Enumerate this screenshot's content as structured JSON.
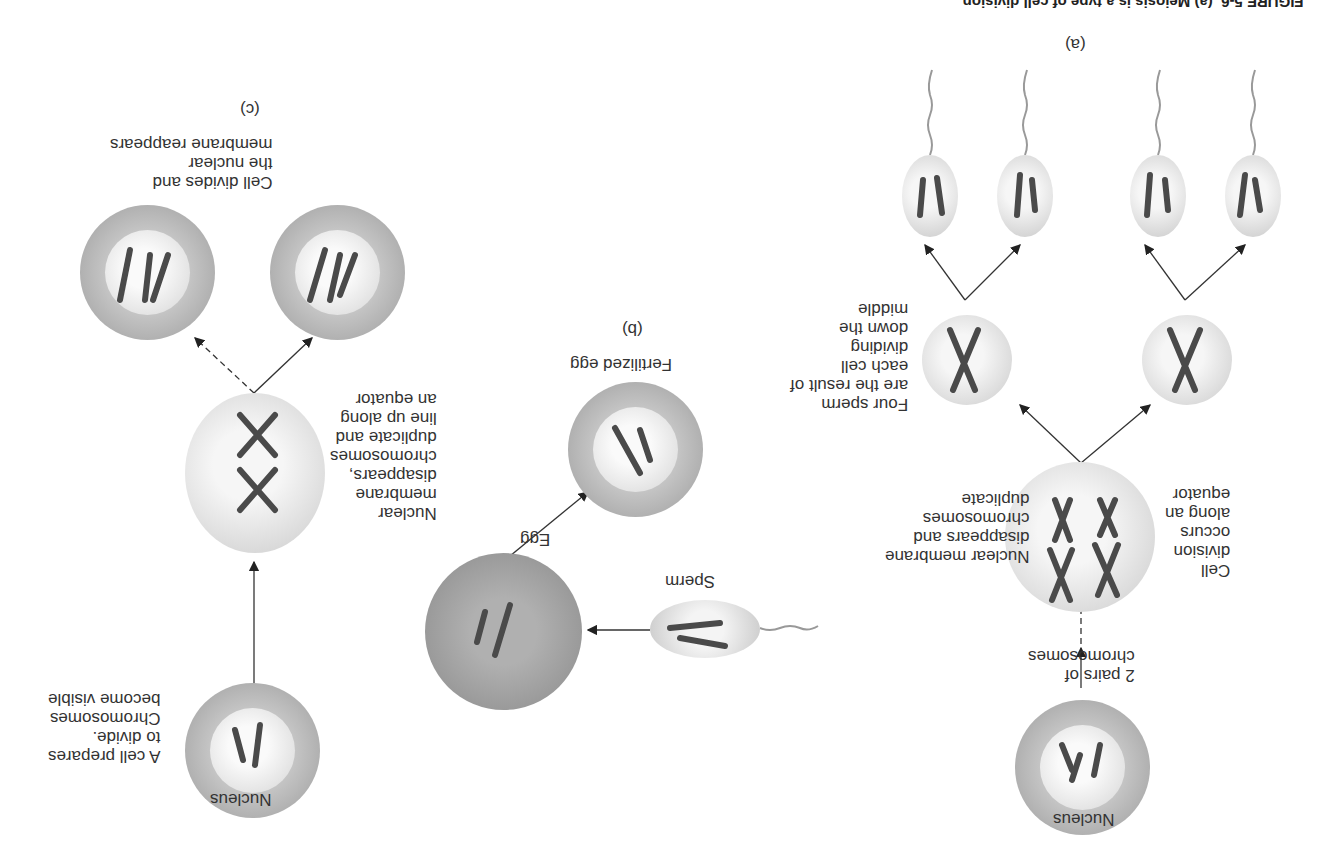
{
  "caption": "FIGURE 5-6  (a) Meiosis is a type of cell division ...",
  "panels": {
    "a": {
      "letter": "(a)",
      "nucleus": "Nucleus",
      "pairs": "2 pairs of\nchromosomes",
      "membrane": "Nuclear membrane\ndisappears and\nchromosomes\nduplicate",
      "division": "Cell\ndivision\noccurs\nalong an\nequator",
      "four_sperm": "Four sperm\nare the result of\neach cell\ndividing\ndown the\nmiddle"
    },
    "b": {
      "letter": "(b)",
      "sperm": "Sperm",
      "egg": "Egg",
      "fertilized": "Fertilized egg"
    },
    "c": {
      "letter": "(c)",
      "nucleus": "Nucleus",
      "prepares": "A cell prepares\nto divide.\nChromosomes\nbecome visible",
      "membrane": "Nuclear\nmembrane\ndisappears,\nchromosomes\nduplicate and\nline up along\nan equator",
      "divides": "Cell divides and\nthe nuclear\nmembrane reappears"
    }
  }
}
